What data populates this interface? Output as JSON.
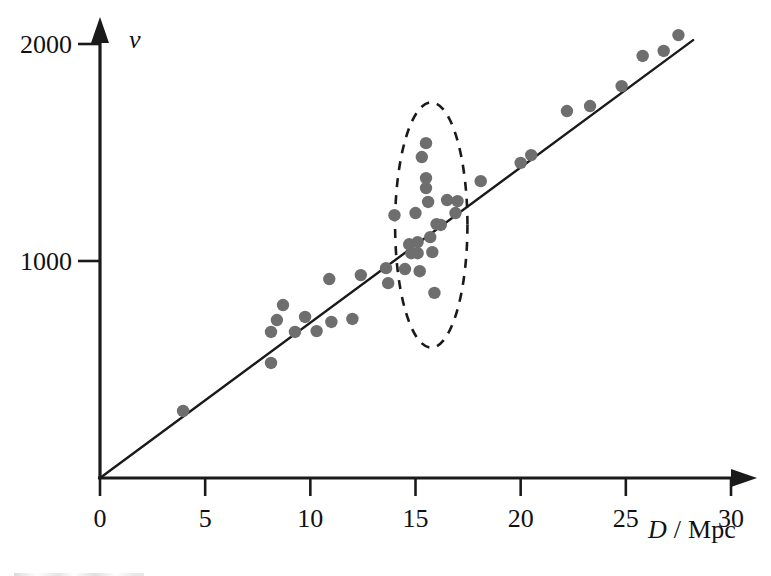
{
  "chart_data": {
    "type": "scatter",
    "title": "",
    "xlabel": "D / Mpc",
    "ylabel": "v",
    "xlabel_symbol": "D",
    "xlabel_unit": "Mpc",
    "xlabel_separator": "/",
    "ylabel_symbol": "v",
    "xlim": [
      0,
      31
    ],
    "ylim": [
      0,
      2100
    ],
    "x_ticks": [
      0,
      5,
      10,
      15,
      20,
      25,
      30
    ],
    "x_tick_labels": [
      "0",
      "5",
      "10",
      "15",
      "20",
      "25",
      "30"
    ],
    "y_ticks": [
      1000,
      2000
    ],
    "y_tick_labels": [
      "1000",
      "2000"
    ],
    "grid": false,
    "legend": false,
    "point_color": "#6e6e6e",
    "line_color": "#1a1a1a",
    "axis_color": "#1a1a1a",
    "fit_line": {
      "label": "best-fit line through origin",
      "slope": 71.5,
      "intercept": 0,
      "x_start": 0,
      "y_start": 0,
      "x_end": 28.2,
      "y_end": 2018
    },
    "annotation_ellipse": {
      "label": "dashed ellipse highlighting galaxy cluster",
      "center_x": 15.75,
      "center_y": 1166,
      "radius_x": 1.72,
      "radius_y": 565,
      "style": "dashed"
    },
    "points": [
      {
        "x": 3.95,
        "y": 309
      },
      {
        "x": 8.13,
        "y": 530
      },
      {
        "x": 8.13,
        "y": 673
      },
      {
        "x": 8.41,
        "y": 728
      },
      {
        "x": 8.7,
        "y": 797
      },
      {
        "x": 9.27,
        "y": 673
      },
      {
        "x": 9.75,
        "y": 742
      },
      {
        "x": 10.3,
        "y": 677
      },
      {
        "x": 10.9,
        "y": 917
      },
      {
        "x": 11.0,
        "y": 719
      },
      {
        "x": 12.0,
        "y": 733
      },
      {
        "x": 12.4,
        "y": 935
      },
      {
        "x": 13.6,
        "y": 967
      },
      {
        "x": 13.7,
        "y": 898
      },
      {
        "x": 14.0,
        "y": 1211
      },
      {
        "x": 14.5,
        "y": 963
      },
      {
        "x": 14.7,
        "y": 1077
      },
      {
        "x": 14.8,
        "y": 1036
      },
      {
        "x": 15.0,
        "y": 1221
      },
      {
        "x": 15.1,
        "y": 1087
      },
      {
        "x": 15.1,
        "y": 1036
      },
      {
        "x": 15.2,
        "y": 953
      },
      {
        "x": 15.3,
        "y": 1479
      },
      {
        "x": 15.5,
        "y": 1543
      },
      {
        "x": 15.5,
        "y": 1382
      },
      {
        "x": 15.5,
        "y": 1336
      },
      {
        "x": 15.6,
        "y": 1272
      },
      {
        "x": 15.7,
        "y": 1110
      },
      {
        "x": 15.8,
        "y": 1041
      },
      {
        "x": 15.9,
        "y": 853
      },
      {
        "x": 16.0,
        "y": 1170
      },
      {
        "x": 16.2,
        "y": 1166
      },
      {
        "x": 16.5,
        "y": 1281
      },
      {
        "x": 16.9,
        "y": 1221
      },
      {
        "x": 17.0,
        "y": 1276
      },
      {
        "x": 18.1,
        "y": 1368
      },
      {
        "x": 20.0,
        "y": 1452
      },
      {
        "x": 20.5,
        "y": 1488
      },
      {
        "x": 22.2,
        "y": 1691
      },
      {
        "x": 23.3,
        "y": 1714
      },
      {
        "x": 24.8,
        "y": 1806
      },
      {
        "x": 25.8,
        "y": 1945
      },
      {
        "x": 26.8,
        "y": 1968
      },
      {
        "x": 27.5,
        "y": 2041
      }
    ]
  }
}
